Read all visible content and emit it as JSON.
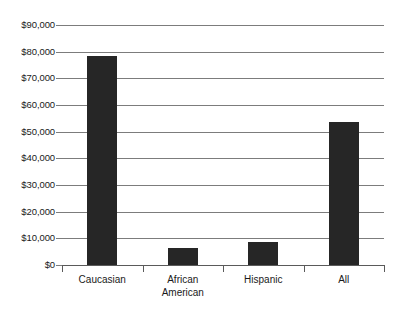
{
  "chart_data": {
    "type": "bar",
    "title": "",
    "subtitle": "",
    "xlabel": "",
    "ylabel": "",
    "categories": [
      "Caucasian",
      "African American",
      "Hispanic",
      "All"
    ],
    "category_lines": [
      [
        "Caucasian"
      ],
      [
        "African",
        "American"
      ],
      [
        "Hispanic"
      ],
      [
        "All"
      ]
    ],
    "values": [
      78500,
      6500,
      8800,
      53500
    ],
    "ylim": [
      0,
      90000
    ],
    "ytick_values": [
      0,
      10000,
      20000,
      30000,
      40000,
      50000,
      60000,
      70000,
      80000,
      90000
    ],
    "ytick_labels": [
      "$0",
      "$10,000",
      "$20,000",
      "$30,000",
      "$40,000",
      "$50,000",
      "$60,000",
      "$70,000",
      "$80,000",
      "$90,000"
    ],
    "grid": true,
    "legend": false,
    "legend_position": "none",
    "bar_color": "#262626",
    "gridline_color": "#7c7c7c",
    "axis_color": "#5a5a5a",
    "background_color": "#ffffff"
  }
}
